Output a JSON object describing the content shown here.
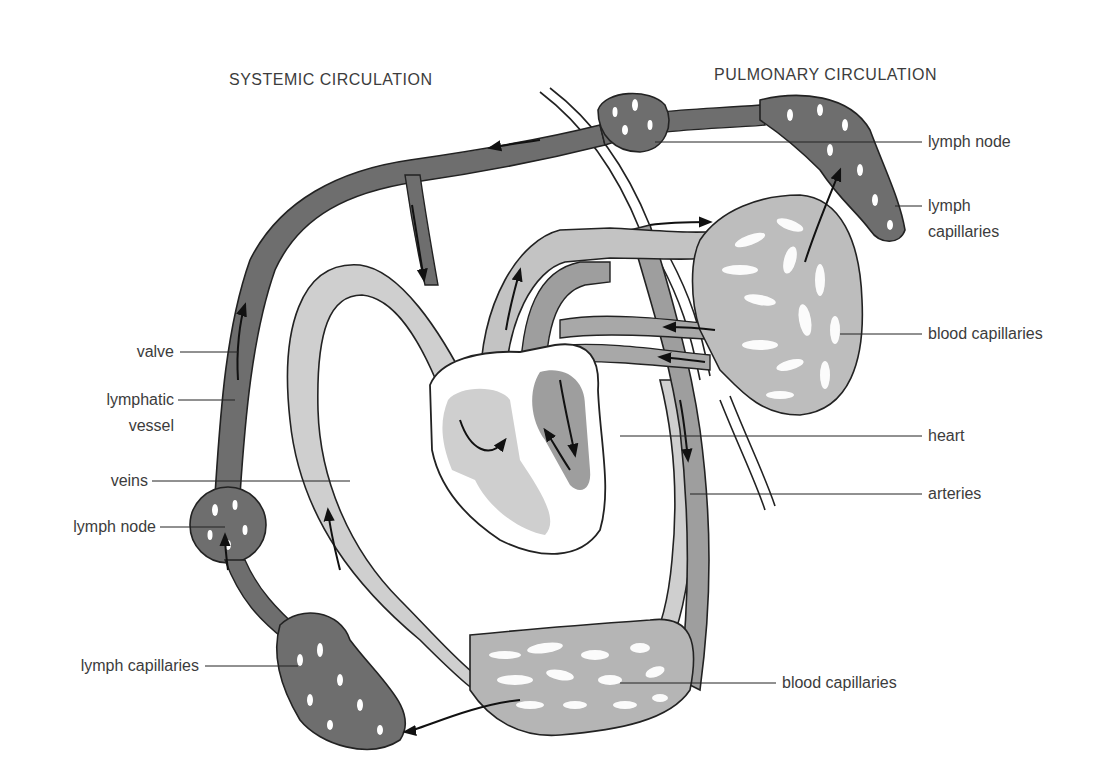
{
  "headers": {
    "systemic": "SYSTEMIC CIRCULATION",
    "pulmonary": "PULMONARY CIRCULATION"
  },
  "labels_left": {
    "valve": "valve",
    "lymphatic_vessel_1": "lymphatic",
    "lymphatic_vessel_2": "vessel",
    "veins": "veins",
    "lymph_node": "lymph node",
    "lymph_capillaries": "lymph capillaries"
  },
  "labels_right": {
    "lymph_node": "lymph node",
    "lymph_capillaries_1": "lymph",
    "lymph_capillaries_2": "capillaries",
    "blood_capillaries_upper": "blood capillaries",
    "heart": "heart",
    "arteries": "arteries",
    "blood_capillaries_lower": "blood capillaries"
  },
  "colors": {
    "lymph": "#6e6e6e",
    "vein": "#c8c8c8",
    "artery": "#9a9a9a",
    "outline": "#222222",
    "background": "#ffffff"
  }
}
